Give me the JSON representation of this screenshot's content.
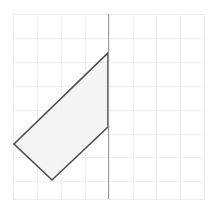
{
  "figure": {
    "canvas": {
      "width": 216,
      "height": 214,
      "background": "#ffffff"
    },
    "grid": {
      "visible": true,
      "x_start": 13,
      "y_start": 14,
      "x_end": 204,
      "y_end": 199,
      "cell_size": 23.9,
      "columns": 8,
      "rows": 8,
      "line_color": "#f0f0f0",
      "line_width": 1,
      "border_color": "#ededed"
    },
    "shapes": [
      {
        "name": "quadrilateral",
        "type": "polygon",
        "points": "14,144 108,53 108,127 52,180",
        "vertices": [
          {
            "label": "left",
            "x": 14,
            "y": 144
          },
          {
            "label": "top",
            "x": 108,
            "y": 53
          },
          {
            "label": "right",
            "x": 108,
            "y": 127
          },
          {
            "label": "bottom",
            "x": 52,
            "y": 180
          }
        ],
        "fill": "#f2f2f2",
        "fill_opacity": 0.85,
        "stroke": "#4a4a4a",
        "stroke_width": 1.6
      }
    ],
    "lines": [
      {
        "name": "vertical-axis-line",
        "type": "line",
        "x1": 108,
        "y1": 14,
        "x2": 108,
        "y2": 199,
        "stroke": "#9a9a9a",
        "stroke_width": 1
      }
    ]
  }
}
